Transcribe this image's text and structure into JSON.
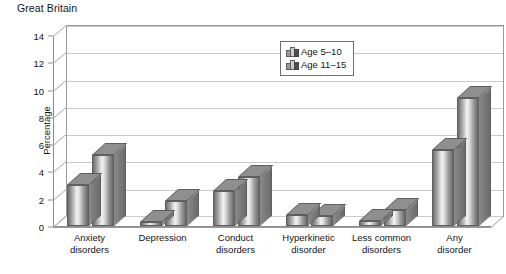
{
  "region_title": "Great Britain",
  "chart_data": {
    "type": "bar",
    "title": "Great Britain",
    "xlabel": "",
    "ylabel": "Percentage",
    "ylim": [
      0,
      14
    ],
    "yticks": [
      0,
      2,
      4,
      6,
      8,
      10,
      12,
      14
    ],
    "grid": true,
    "legend_position": "top-right",
    "style": "3d-columns",
    "categories": [
      "Anxiety disorders",
      "Depression",
      "Conduct disorders",
      "Hyperkinetic disorder",
      "Less common disorders",
      "Any disorder"
    ],
    "series": [
      {
        "name": "Age 5–10",
        "values": [
          3.0,
          0.3,
          2.6,
          0.8,
          0.4,
          5.6
        ]
      },
      {
        "name": "Age 11–15",
        "values": [
          5.2,
          1.8,
          3.6,
          0.7,
          1.2,
          9.4
        ]
      }
    ]
  },
  "axis": {
    "y_title": "Percentage",
    "y_ticks": [
      "0",
      "2",
      "4",
      "6",
      "8",
      "10",
      "12",
      "14"
    ],
    "x_categories": [
      {
        "line1": "Anxiety",
        "line2": "disorders"
      },
      {
        "line1": "Depression",
        "line2": ""
      },
      {
        "line1": "Conduct",
        "line2": "disorders"
      },
      {
        "line1": "Hyperkinetic",
        "line2": "disorder"
      },
      {
        "line1": "Less common",
        "line2": "disorders"
      },
      {
        "line1": "Any",
        "line2": "disorder"
      }
    ]
  },
  "legend": {
    "items": [
      {
        "label": "Age 5–10"
      },
      {
        "label": "Age 11–15"
      }
    ]
  },
  "colors": {
    "axis": "#8c8c8c",
    "gridline": "#c9c9c9",
    "bar_light": "#f4f4f4",
    "bar_dark": "#666666",
    "text": "#141414"
  }
}
